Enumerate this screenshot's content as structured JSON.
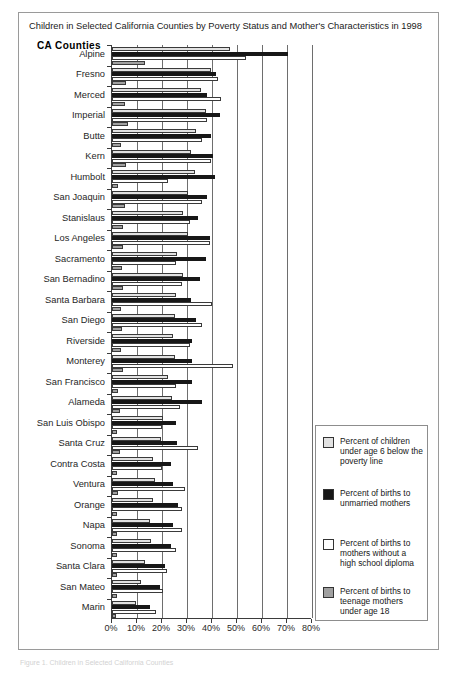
{
  "title": "Children in Selected California Counties by Poverty Status and Mother's Characteristics in 1998",
  "y_axis_title": "CA  Counties",
  "footnote": "Figure 1.  Children in Selected California Counties",
  "legend": {
    "items": [
      {
        "key": "s0",
        "label": "Percent of children under age 6 below the poverty line",
        "color": "#e2e2e2"
      },
      {
        "key": "s1",
        "label": "Percent of births to unmarried mothers",
        "color": "#171717"
      },
      {
        "key": "s2",
        "label": "Percent of births to mothers without a high school diploma",
        "color": "#ffffff"
      },
      {
        "key": "s3",
        "label": "Percent of births to teenage mothers under age 18",
        "color": "#a0a0a0"
      }
    ]
  },
  "chart_data": {
    "type": "bar",
    "orientation": "horizontal",
    "title": "Children in Selected California Counties by Poverty Status and Mother's Characteristics in 1998",
    "xlabel": "",
    "ylabel": "CA  Counties",
    "xlim": [
      0,
      80
    ],
    "xticks": [
      0,
      10,
      20,
      30,
      40,
      50,
      60,
      70,
      80
    ],
    "xticklabels": [
      "0%",
      "10%",
      "20%",
      "30%",
      "40%",
      "50%",
      "60%",
      "70%",
      "80%"
    ],
    "grid": true,
    "legend_position": "right-lower",
    "categories": [
      "Alpine",
      "Fresno",
      "Merced",
      "Imperial",
      "Butte",
      "Kern",
      "Humbolt",
      "San Joaquin",
      "Stanislaus",
      "Los Angeles",
      "Sacramento",
      "San Bernadino",
      "Santa Barbara",
      "San Diego",
      "Riverside",
      "Monterey",
      "San Francisco",
      "Alameda",
      "San Luis Obispo",
      "Santa Cruz",
      "Contra Costa",
      "Ventura",
      "Orange",
      "Napa",
      "Sonoma",
      "Santa Clara",
      "San Mateo",
      "Marin"
    ],
    "series": [
      {
        "name": "Percent of children under age 6 below the poverty line",
        "color": "#e2e2e2",
        "values": [
          47.0,
          39.5,
          35.5,
          37.5,
          33.5,
          31.5,
          33.0,
          30.5,
          28.5,
          30.5,
          26.0,
          28.5,
          25.5,
          25.0,
          24.5,
          25.0,
          22.5,
          24.0,
          20.5,
          19.5,
          16.5,
          17.0,
          16.5,
          15.0,
          15.5,
          13.0,
          11.5,
          9.5
        ]
      },
      {
        "name": "Percent of births to unmarried mothers",
        "color": "#171717",
        "values": [
          70.5,
          41.5,
          38.0,
          43.0,
          39.5,
          40.5,
          41.0,
          38.0,
          34.5,
          39.0,
          37.5,
          35.0,
          31.5,
          33.5,
          32.0,
          32.0,
          32.0,
          36.0,
          25.5,
          26.0,
          23.5,
          24.5,
          26.5,
          24.5,
          23.5,
          21.0,
          19.0,
          15.0
        ]
      },
      {
        "name": "Percent of births to mothers without a high school diploma",
        "color": "#ffffff",
        "values": [
          53.5,
          42.5,
          43.5,
          38.0,
          36.0,
          39.5,
          22.5,
          36.0,
          31.0,
          39.0,
          25.5,
          28.0,
          40.0,
          36.0,
          31.0,
          48.5,
          25.5,
          27.0,
          20.0,
          34.5,
          20.0,
          29.0,
          28.0,
          28.0,
          25.5,
          22.0,
          20.5,
          17.5
        ]
      },
      {
        "name": "Percent of births to teenage mothers under age 18",
        "color": "#a0a0a0",
        "values": [
          13.0,
          5.5,
          5.0,
          6.5,
          3.5,
          5.5,
          2.5,
          5.0,
          4.5,
          4.5,
          4.0,
          4.5,
          3.5,
          4.0,
          3.5,
          4.5,
          2.5,
          3.0,
          2.0,
          3.0,
          2.0,
          2.5,
          2.0,
          2.0,
          2.0,
          2.0,
          2.0,
          1.5
        ]
      }
    ]
  }
}
